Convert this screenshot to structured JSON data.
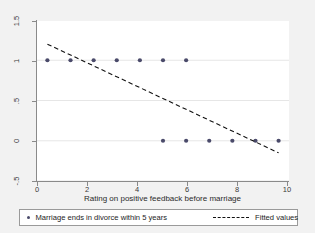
{
  "chart_data": {
    "type": "scatter",
    "title": "",
    "subtitle": "",
    "xlabel": "Rating on positive feedback before marriage",
    "ylabel": "",
    "xlim": [
      -0.45,
      10.45
    ],
    "ylim": [
      -0.5,
      1.5
    ],
    "xticks": [
      0,
      2,
      4,
      6,
      8,
      10
    ],
    "xtick_labels": [
      "0",
      "2",
      "4",
      "6",
      "8",
      "10"
    ],
    "yticks": [
      -0.5,
      0,
      0.5,
      1,
      1.5
    ],
    "ytick_labels": [
      "-.5",
      "0",
      ".5",
      "1",
      "1.5"
    ],
    "grid": "horizontal",
    "legend_position": "bottom",
    "series": [
      {
        "name": "Marriage ends in divorce within 5 years",
        "type": "scatter",
        "marker": "circle",
        "color": "#4a4a6a",
        "x": [
          0,
          1,
          2,
          3,
          4,
          5,
          6,
          5,
          6,
          7,
          8,
          9,
          10
        ],
        "y": [
          1,
          1,
          1,
          1,
          1,
          1,
          1,
          0,
          0,
          0,
          0,
          0,
          0
        ]
      },
      {
        "name": "Fitted values",
        "type": "line",
        "style": "dashed",
        "color": "#111111",
        "x": [
          0,
          10
        ],
        "y": [
          1.2,
          -0.15
        ]
      }
    ]
  },
  "axes": {
    "x_title": "Rating on positive feedback before marriage",
    "x_tick_labels": [
      "0",
      "2",
      "4",
      "6",
      "8",
      "10"
    ],
    "y_tick_labels": [
      "1.5",
      "1",
      ".5",
      "0",
      "-.5"
    ]
  },
  "legend": {
    "points_label": "Marriage ends in divorce within 5 years",
    "line_label": "Fitted values",
    "point_marker_icon": "filled-circle-marker-icon",
    "line_marker_icon": "dashed-line-marker-icon"
  },
  "colors": {
    "figure_background": "#f2f2f2",
    "plot_background": "#ffffff",
    "axis": "#8a8a8a",
    "marker": "#4a4a6a",
    "fit_line": "#111111",
    "gridline": "#e6e6e6",
    "text": "#2b2b2b"
  }
}
